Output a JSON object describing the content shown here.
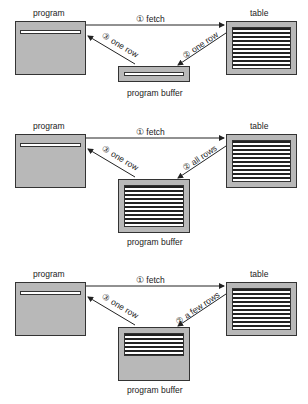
{
  "labels": {
    "program": "program",
    "table": "table",
    "buffer": "program buffer"
  },
  "panels": [
    {
      "fetch": "① fetch",
      "to_buffer": "② one row",
      "to_program": "③ one row",
      "buffer_rows": 1
    },
    {
      "fetch": "① fetch",
      "to_buffer": "② all rows",
      "to_program": "③ one row",
      "buffer_rows": "all"
    },
    {
      "fetch": "① fetch",
      "to_buffer": "② a few rows",
      "to_program": "③ one row",
      "buffer_rows": "few"
    }
  ]
}
